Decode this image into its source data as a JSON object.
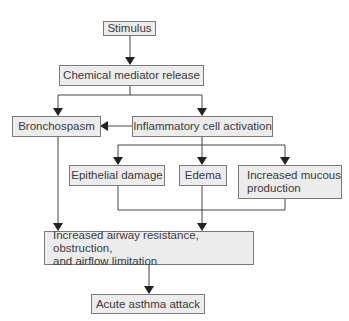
{
  "diagram": {
    "nodes": {
      "stimulus": "Stimulus",
      "chemical": "Chemical mediator release",
      "bronchospasm": "Bronchospasm",
      "inflammatory": "Inflammatory cell activation",
      "epithelial": "Epithelial damage",
      "edema": "Edema",
      "mucous_1": "Increased mucous",
      "mucous_2": "production",
      "airway_1": "Increased airway resistance, obstruction,",
      "airway_2": "and airflow limitation",
      "acute": "Acute asthma attack"
    },
    "edges": [
      [
        "Stimulus",
        "Chemical mediator release"
      ],
      [
        "Chemical mediator release",
        "Bronchospasm"
      ],
      [
        "Chemical mediator release",
        "Inflammatory cell activation"
      ],
      [
        "Inflammatory cell activation",
        "Bronchospasm"
      ],
      [
        "Inflammatory cell activation",
        "Epithelial damage"
      ],
      [
        "Inflammatory cell activation",
        "Edema"
      ],
      [
        "Inflammatory cell activation",
        "Increased mucous production"
      ],
      [
        "Bronchospasm",
        "Increased airway resistance, obstruction, and airflow limitation"
      ],
      [
        "Epithelial damage / Edema / Increased mucous production",
        "Increased airway resistance, obstruction, and airflow limitation"
      ],
      [
        "Increased airway resistance, obstruction, and airflow limitation",
        "Acute asthma attack"
      ]
    ],
    "colors": {
      "box_fill": "#ececec",
      "box_border": "#7a7a7a",
      "line": "#333333"
    }
  }
}
